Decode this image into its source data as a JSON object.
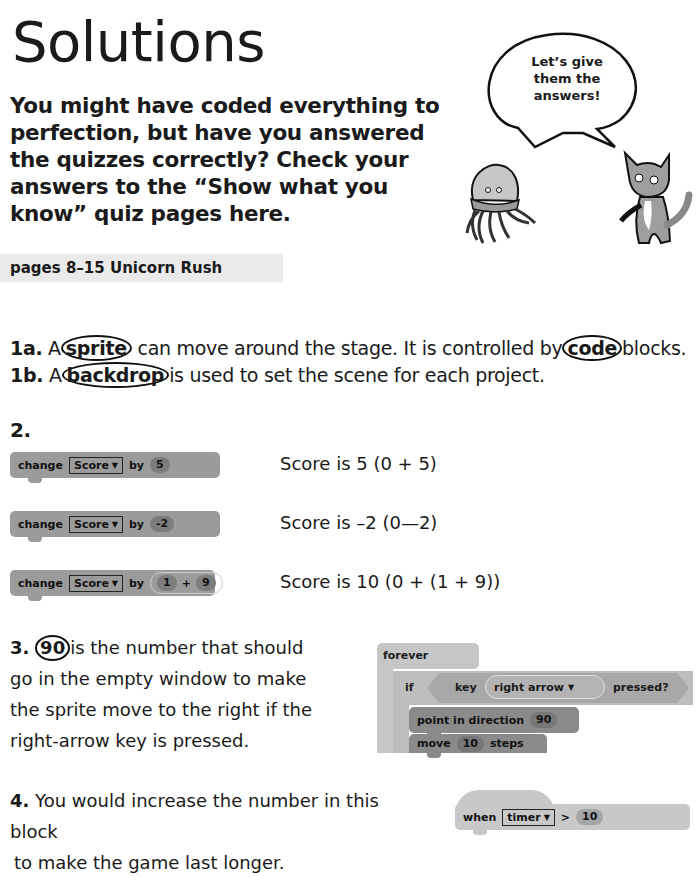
{
  "page": {
    "title": "Solutions",
    "intro": "You might have coded everything to perfection, but have you answered the quizzes correctly? Check your answers to the “Show what you know” quiz pages here.",
    "illustration": {
      "speech_bubble": "Let’s give them the answers!",
      "characters": [
        "jellyfish",
        "cat"
      ]
    },
    "section": "pages 8–15 Unicorn Rush"
  },
  "q1": {
    "a": {
      "number": "1a.",
      "pre": "A",
      "circled1": "sprite",
      "mid": "can move around the stage. It is controlled by",
      "circled2": "code",
      "post": "blocks."
    },
    "b": {
      "number": "1b.",
      "pre": "A",
      "circled": "backdrop",
      "post": "is used to set the scene for each project."
    }
  },
  "q2": {
    "number": "2.",
    "rows": [
      {
        "block": {
          "verb": "change",
          "variable": "Score",
          "by": "by",
          "value": "5"
        },
        "answer": "Score is 5 (0 + 5)"
      },
      {
        "block": {
          "verb": "change",
          "variable": "Score",
          "by": "by",
          "value": "-2"
        },
        "answer": "Score is –2 (0—2)"
      },
      {
        "block": {
          "verb": "change",
          "variable": "Score",
          "by": "by",
          "op_left": "1",
          "op": "+",
          "op_right": "9"
        },
        "answer": "Score is 10 (0 + (1 + 9))"
      }
    ]
  },
  "q3": {
    "number": "3.",
    "circled": "90",
    "lines": [
      "is the number that should",
      "go in the empty window to make",
      "the sprite move to the right if the",
      "right-arrow key is pressed."
    ],
    "script": {
      "forever": "forever",
      "if": "if",
      "key": "key",
      "key_value": "right arrow",
      "pressed": "pressed?",
      "point": "point in direction",
      "point_value": "90",
      "move": "move",
      "move_value": "10",
      "steps": "steps"
    }
  },
  "q4": {
    "number": "4.",
    "lines": [
      "You would increase the number in this block",
      "to make the game last longer."
    ],
    "block": {
      "when": "when",
      "sensor": "timer",
      "op": ">",
      "value": "10"
    }
  },
  "colors": {
    "block_dark": "#9b9b9b",
    "block_light": "#c6c6c6",
    "section_bar": "#eaeaea"
  }
}
